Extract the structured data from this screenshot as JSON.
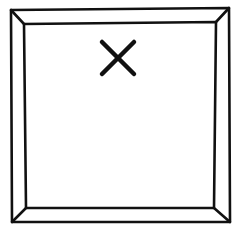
{
  "figure": {
    "stroke_color": "#111111",
    "background": "#ffffff",
    "outer_square": {
      "tl": [
        11,
        10
      ],
      "tr": [
        229,
        8
      ],
      "br": [
        230,
        222
      ],
      "bl": [
        12,
        222
      ]
    },
    "inner_square": {
      "tl": [
        24,
        24
      ],
      "tr": [
        216,
        22
      ],
      "br": [
        214,
        208
      ],
      "bl": [
        26,
        208
      ]
    },
    "x_mark": {
      "center": [
        118,
        58
      ],
      "half_size": 16
    }
  }
}
